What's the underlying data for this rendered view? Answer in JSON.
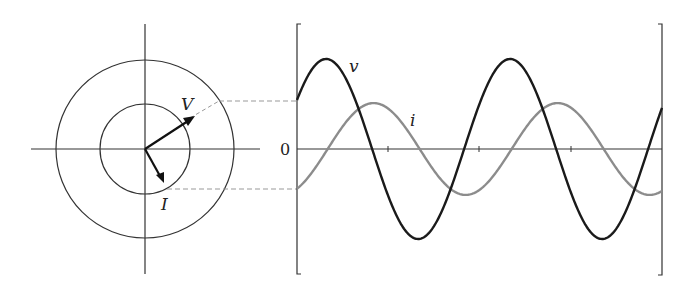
{
  "phasor_diagram": {
    "origin": [
      145,
      149
    ],
    "outer_radius": 89,
    "inner_radius": 45,
    "voltage_label": "V",
    "current_label": "I",
    "voltage_angle_deg": 33,
    "current_angle_deg": -60
  },
  "waveform_plot": {
    "zero_label": "0",
    "voltage_label": "v",
    "current_label": "i",
    "colors": {
      "voltage": "#1a1a1a",
      "current": "#8c8c8c",
      "axes": "#333333",
      "dashed": "#999999"
    }
  },
  "chart_data": {
    "type": "line",
    "title": "",
    "xlabel": "",
    "ylabel": "",
    "series": [
      {
        "name": "v",
        "amplitude": 1.0,
        "phase_deg": 33,
        "cycles_shown": 2.0
      },
      {
        "name": "i",
        "amplitude": 0.51,
        "phase_deg": -60,
        "cycles_shown": 2.0
      }
    ],
    "y_tick_labels": [
      "0"
    ],
    "x_ticks_count": 3,
    "grid": false
  }
}
